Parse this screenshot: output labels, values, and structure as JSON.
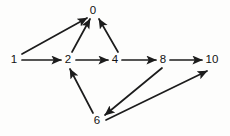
{
  "figure": {
    "kind": "directed-graph",
    "background_color": "#fdfdfc",
    "stroke_color": "#1c1c1c",
    "label_color": "#121212",
    "width": 230,
    "height": 136
  },
  "graph": {
    "directed": true,
    "nodes": [
      {
        "id": "0",
        "label": "0",
        "x": 93,
        "y": 11
      },
      {
        "id": "1",
        "label": "1",
        "x": 14,
        "y": 60
      },
      {
        "id": "2",
        "label": "2",
        "x": 68,
        "y": 60
      },
      {
        "id": "4",
        "label": "4",
        "x": 115,
        "y": 60
      },
      {
        "id": "6",
        "label": "6",
        "x": 97,
        "y": 121
      },
      {
        "id": "8",
        "label": "8",
        "x": 163,
        "y": 60
      },
      {
        "id": "10",
        "label": "10",
        "x": 212,
        "y": 60
      }
    ],
    "edges": [
      {
        "from": "1",
        "to": "0",
        "x1": 22,
        "y1": 54,
        "x2": 87,
        "y2": 18
      },
      {
        "from": "1",
        "to": "2",
        "x1": 22,
        "y1": 60,
        "x2": 61,
        "y2": 60
      },
      {
        "from": "2",
        "to": "0",
        "x1": 72,
        "y1": 52,
        "x2": 90,
        "y2": 19
      },
      {
        "from": "2",
        "to": "4",
        "x1": 76,
        "y1": 60,
        "x2": 108,
        "y2": 60
      },
      {
        "from": "4",
        "to": "0",
        "x1": 118,
        "y1": 52,
        "x2": 99,
        "y2": 19
      },
      {
        "from": "4",
        "to": "8",
        "x1": 122,
        "y1": 60,
        "x2": 156,
        "y2": 60
      },
      {
        "from": "8",
        "to": "10",
        "x1": 170,
        "y1": 60,
        "x2": 202,
        "y2": 60
      },
      {
        "from": "8",
        "to": "6",
        "x1": 162,
        "y1": 68,
        "x2": 105,
        "y2": 115
      },
      {
        "from": "6",
        "to": "2",
        "x1": 93,
        "y1": 113,
        "x2": 70,
        "y2": 69
      },
      {
        "from": "6",
        "to": "10",
        "x1": 106,
        "y1": 120,
        "x2": 207,
        "y2": 71
      }
    ]
  }
}
